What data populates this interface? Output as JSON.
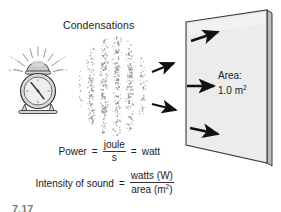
{
  "figure": {
    "title_label": "Condensations",
    "caption": "7.17",
    "panel": {
      "area_line1": "Area:",
      "area_line2_value": "1.0 m",
      "area_line2_exponent": "2"
    },
    "equations": {
      "power": {
        "lhs": "Power",
        "equals_1": "=",
        "numerator": "joule",
        "denominator": "s",
        "equals_2": "=",
        "rhs": "watt"
      },
      "intensity": {
        "lhs": "Intensity of sound",
        "equals": "=",
        "numerator": "watts (W)",
        "denominator_text": "area (m",
        "denominator_exponent": "2",
        "denominator_close": ")"
      }
    },
    "icons": {
      "sound_source": "alarm-clock-icon",
      "wave_cloud": "condensation-dots-icon",
      "incoming_arrows": "sound-direction-arrow-icon",
      "surface_arrows": "surface-flow-arrow-icon",
      "surface": "area-panel-icon"
    },
    "colors": {
      "ink": "#1c1c1c",
      "panel_face": "#ececec",
      "panel_edge": "#9a9a9a",
      "arrow": "#111111",
      "dots": "#8a8a8a",
      "clock_fill": "#cccccc"
    }
  }
}
